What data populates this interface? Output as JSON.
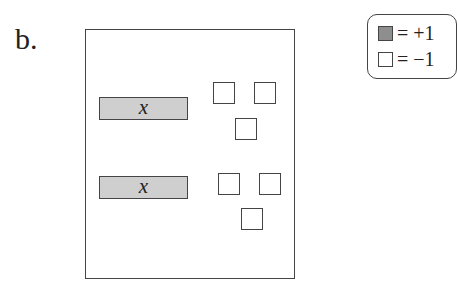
{
  "problem_label": "b.",
  "mat": {
    "groups": [
      {
        "variable_tile": {
          "label": "x"
        },
        "unit_tiles": [
          "-1",
          "-1",
          "-1"
        ]
      },
      {
        "variable_tile": {
          "label": "x"
        },
        "unit_tiles": [
          "-1",
          "-1",
          "-1"
        ]
      }
    ]
  },
  "legend": {
    "items": [
      {
        "swatch": "shaded",
        "text": "= +1"
      },
      {
        "swatch": "white",
        "text": "= −1"
      }
    ]
  },
  "colors": {
    "shaded_tile": "#8e8e8e",
    "x_tile": "#cfcfcf",
    "outline": "#444444"
  }
}
